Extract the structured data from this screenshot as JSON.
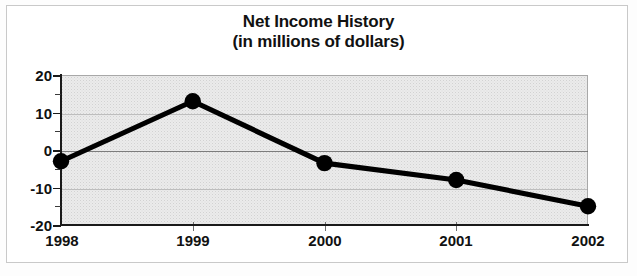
{
  "figure": {
    "title_line1": "Net Income History",
    "title_line2": "(in millions of dollars)",
    "border_color": "#6e6e6e",
    "plot_background": "#ebebeb",
    "series_color": "#000000"
  },
  "chart_data": {
    "type": "line",
    "title": "Net Income History (in millions of dollars)",
    "xlabel": "",
    "ylabel": "",
    "categories": [
      "1998",
      "1999",
      "2000",
      "2001",
      "2002"
    ],
    "values": [
      -3,
      13,
      -3.5,
      -8,
      -15
    ],
    "series": [
      {
        "name": "Net Income",
        "values": [
          -3,
          13,
          -3.5,
          -8,
          -15
        ]
      }
    ],
    "ylim": [
      -20,
      20
    ],
    "ytick_labels": [
      "20",
      "10",
      "0",
      "-10",
      "-20"
    ],
    "ytick_values": [
      20,
      10,
      0,
      -10,
      -20
    ],
    "yminor_values": [
      15,
      5,
      -5,
      -15
    ],
    "grid": true,
    "legend": false,
    "marker": "filled-circle",
    "units": "millions of dollars"
  }
}
